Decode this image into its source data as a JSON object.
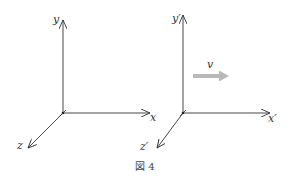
{
  "figure": {
    "caption": "図 4",
    "colors": {
      "axis": "#333333",
      "velocity_arrow": "#b8b8b8"
    },
    "frames": [
      {
        "name": "S",
        "origin": [
          63,
          113
        ],
        "labels": {
          "x": "x",
          "y": "y",
          "z": "z"
        }
      },
      {
        "name": "S'",
        "origin": [
          183,
          113
        ],
        "labels": {
          "x": "x′",
          "y": "y′",
          "z": "z′"
        }
      }
    ],
    "velocity": {
      "label": "v",
      "direction": "+x"
    }
  }
}
